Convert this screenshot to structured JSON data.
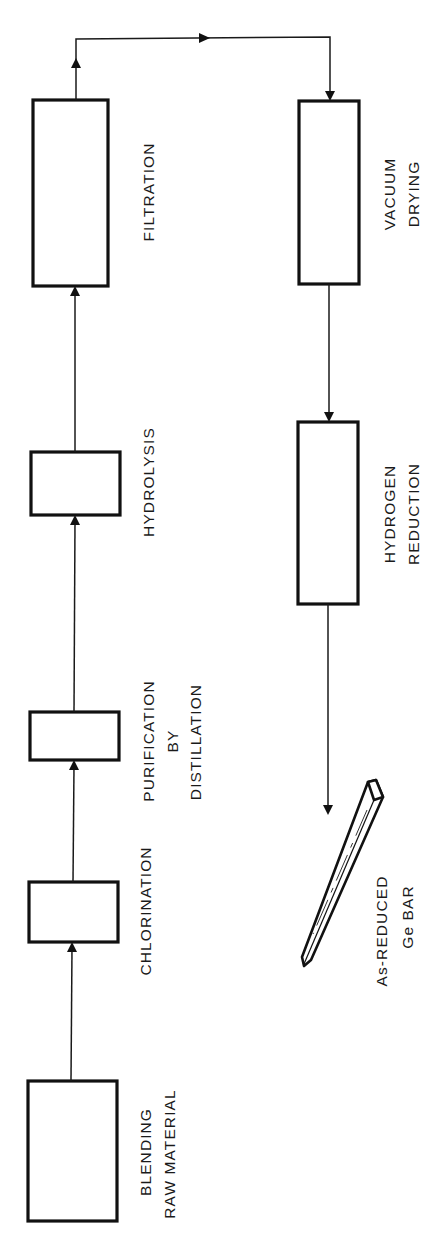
{
  "diagram": {
    "type": "process-flow",
    "orientation": "rotated-90-ccw",
    "steps": [
      {
        "id": "blending",
        "lines": [
          "BLENDING",
          "RAW MATERIAL"
        ]
      },
      {
        "id": "chlorination",
        "lines": [
          "CHLORINATION"
        ]
      },
      {
        "id": "purification",
        "lines": [
          "PURIFICATION",
          "BY",
          "DISTILLATION"
        ]
      },
      {
        "id": "hydrolysis",
        "lines": [
          "HYDROLYSIS"
        ]
      },
      {
        "id": "filtration",
        "lines": [
          "FILTRATION"
        ]
      },
      {
        "id": "vacuum-drying",
        "lines": [
          "VACUUM",
          "DRYING"
        ]
      },
      {
        "id": "hydrogen-reduction",
        "lines": [
          "HYDROGEN",
          "REDUCTION"
        ]
      }
    ],
    "output": {
      "id": "ge-bar",
      "lines": [
        "As-REDUCED",
        "Ge BAR"
      ]
    },
    "edges": [
      {
        "from": "blending",
        "to": "chlorination"
      },
      {
        "from": "chlorination",
        "to": "purification"
      },
      {
        "from": "purification",
        "to": "hydrolysis"
      },
      {
        "from": "hydrolysis",
        "to": "filtration"
      },
      {
        "from": "filtration",
        "to": "vacuum-drying"
      },
      {
        "from": "vacuum-drying",
        "to": "hydrogen-reduction"
      },
      {
        "from": "hydrogen-reduction",
        "to": "ge-bar"
      }
    ],
    "colors": {
      "line": "#111111",
      "background": "#ffffff"
    }
  }
}
